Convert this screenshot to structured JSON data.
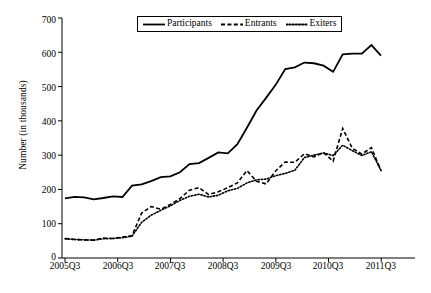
{
  "chart_data": {
    "type": "line",
    "title": "",
    "xlabel": "",
    "ylabel": "Number (in thousands)",
    "ylim": [
      0,
      700
    ],
    "yticks": [
      0,
      100,
      200,
      300,
      400,
      500,
      600,
      700
    ],
    "xtick_labels": [
      "2005Q3",
      "2006Q3",
      "2007Q3",
      "2008Q3",
      "2009Q3",
      "2010Q3",
      "2011Q3"
    ],
    "grid": false,
    "legend_position": "top-center",
    "x": [
      "2005Q3",
      "2005Q4",
      "2006Q1",
      "2006Q2",
      "2006Q3",
      "2006Q4",
      "2007Q1",
      "2007Q2",
      "2007Q3",
      "2007Q4",
      "2008Q1",
      "2008Q2",
      "2008Q3",
      "2008Q4",
      "2009Q1",
      "2009Q2",
      "2009Q3",
      "2009Q4",
      "2010Q1",
      "2010Q2",
      "2010Q3",
      "2010Q4",
      "2011Q1",
      "2011Q2",
      "2011Q3"
    ],
    "series": [
      {
        "name": "Participants",
        "style": "solid",
        "color": "#000000",
        "values": [
          174,
          178,
          177,
          171,
          175,
          180,
          178,
          211,
          215,
          224,
          236,
          238,
          250,
          274,
          277,
          292,
          308,
          305,
          332,
          380,
          430,
          467,
          505,
          551,
          556
        ]
      },
      {
        "name": "Entrants",
        "style": "dashed",
        "color": "#000000",
        "values": [
          57,
          54,
          53,
          52,
          58,
          57,
          61,
          65,
          131,
          150,
          142,
          156,
          173,
          198,
          205,
          185,
          193,
          205,
          219,
          255,
          224,
          216,
          254,
          280,
          279
        ]
      },
      {
        "name": "Exiters",
        "style": "dotted",
        "color": "#000000",
        "values": [
          56,
          54,
          53,
          52,
          56,
          57,
          59,
          64,
          104,
          125,
          139,
          152,
          168,
          180,
          186,
          178,
          183,
          196,
          203,
          219,
          228,
          230,
          240,
          247,
          256
        ]
      }
    ],
    "series_tail": [
      {
        "name": "Participants",
        "values": [
          556,
          570,
          568,
          561,
          543,
          594,
          596,
          596,
          621,
          590
        ]
      },
      {
        "name": "Entrants",
        "values": [
          279,
          304,
          295,
          308,
          282,
          378,
          320,
          303,
          322,
          255
        ]
      },
      {
        "name": "Exiters",
        "values": [
          256,
          293,
          300,
          306,
          299,
          329,
          313,
          299,
          310,
          255
        ]
      }
    ]
  },
  "legend": {
    "items": [
      {
        "label": "Participants",
        "style": "solid"
      },
      {
        "label": "Entrants",
        "style": "dashed"
      },
      {
        "label": "Exiters",
        "style": "dotted"
      }
    ]
  },
  "axes": {
    "y_title": "Number (in thousands)",
    "y_labels": [
      "700",
      "600",
      "500",
      "400",
      "300",
      "200",
      "100",
      "0"
    ],
    "x_labels": [
      "2005Q3",
      "2006Q3",
      "2007Q3",
      "2008Q3",
      "2009Q3",
      "2010Q3",
      "2011Q3"
    ]
  }
}
